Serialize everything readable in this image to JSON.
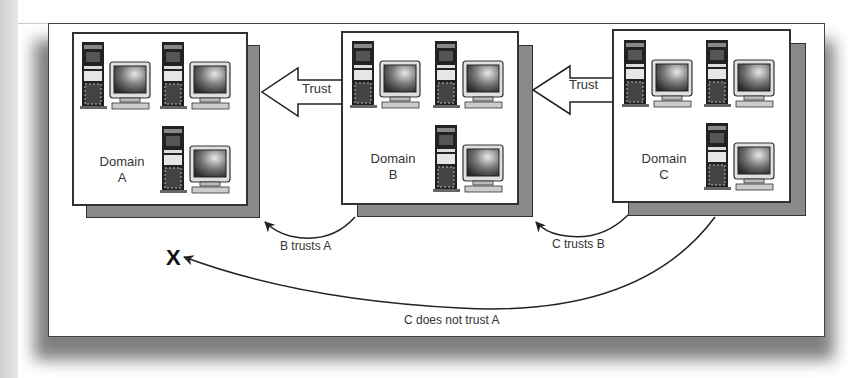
{
  "diagram": {
    "domains": [
      {
        "id": "A",
        "label_line1": "Domain",
        "label_line2": "A",
        "computers": 3
      },
      {
        "id": "B",
        "label_line1": "Domain",
        "label_line2": "B",
        "computers": 3
      },
      {
        "id": "C",
        "label_line1": "Domain",
        "label_line2": "C",
        "computers": 3
      }
    ],
    "trust_arrows": [
      {
        "from": "B",
        "to": "A",
        "label": "Trust"
      },
      {
        "from": "C",
        "to": "B",
        "label": "Trust"
      }
    ],
    "captions": {
      "b_trusts_a": "B trusts A",
      "c_trusts_b": "C trusts B",
      "c_not_trust_a": "C does not trust A"
    },
    "no_trust_mark": "X",
    "colors": {
      "shadow": "#8a8a8a",
      "border": "#333333",
      "background": "#ffffff"
    }
  }
}
